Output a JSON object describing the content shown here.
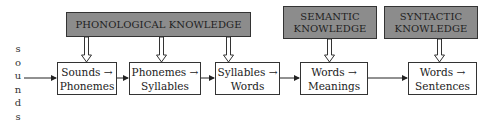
{
  "diagram": {
    "input_label_letters": [
      "s",
      "o",
      "u",
      "n",
      "d",
      "s"
    ],
    "knowledge_sources": [
      {
        "line1": "PHONOLOGICAL KNOWLEDGE",
        "line2": ""
      },
      {
        "line1": "SEMANTIC",
        "line2": "KNOWLEDGE"
      },
      {
        "line1": "SYNTACTIC",
        "line2": "KNOWLEDGE"
      }
    ],
    "stages": [
      {
        "line1": "Sounds →",
        "line2": "Phonemes"
      },
      {
        "line1": "Phonemes →",
        "line2": "Syllables"
      },
      {
        "line1": "Syllables →",
        "line2": "Words"
      },
      {
        "line1": "Words →",
        "line2": "Meanings"
      },
      {
        "line1": "Words →",
        "line2": "Sentences"
      }
    ],
    "colors": {
      "knowledge_fill": "#8c8c8c",
      "stage_fill": "#ffffff",
      "stroke": "#333333"
    }
  }
}
